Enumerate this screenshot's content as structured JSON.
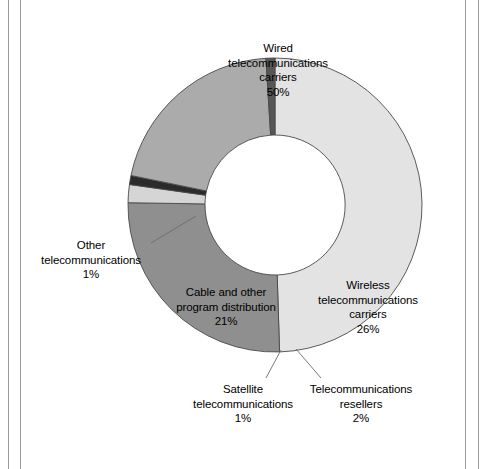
{
  "figure": {
    "background": "#ffffff",
    "frame_rule_color": "#9a9a9a"
  },
  "chart_data": {
    "type": "pie",
    "variant": "donut",
    "title": "",
    "subtitle": "",
    "xlabel": "",
    "ylabel": "",
    "legend": "none",
    "grid": false,
    "units": "percent",
    "total": 101,
    "start_angle_deg": 0,
    "direction": "clockwise",
    "center": {
      "x": 275,
      "y": 205
    },
    "outer_radius": 147,
    "inner_radius": 70,
    "labels": [
      "Wired telecommunications carriers",
      "Wireless telecommunications carriers",
      "Telecommunications resellers",
      "Satellite telecommunications",
      "Cable and other program distribution",
      "Other telecommunications"
    ],
    "values": [
      50,
      26,
      2,
      1,
      21,
      1
    ],
    "colors": [
      "#e3e3e3",
      "#8f8f8f",
      "#d5d5d5",
      "#2b2b2b",
      "#ababab",
      "#565656"
    ],
    "slices": [
      {
        "name": "wired",
        "label_lines": [
          "Wired",
          "telecommunications",
          "carriers"
        ],
        "value": 50,
        "pct_text": "50%",
        "color": "#e3e3e3",
        "label_placement": "inside"
      },
      {
        "name": "wireless",
        "label_lines": [
          "Wireless",
          "telecommunications",
          "carriers"
        ],
        "value": 26,
        "pct_text": "26%",
        "color": "#8f8f8f",
        "label_placement": "inside"
      },
      {
        "name": "resellers",
        "label_lines": [
          "Telecommunications",
          "resellers"
        ],
        "value": 2,
        "pct_text": "2%",
        "color": "#d5d5d5",
        "label_placement": "callout"
      },
      {
        "name": "satellite",
        "label_lines": [
          "Satellite",
          "telecommunications"
        ],
        "value": 1,
        "pct_text": "1%",
        "color": "#2b2b2b",
        "label_placement": "callout"
      },
      {
        "name": "cable",
        "label_lines": [
          "Cable and other",
          "program distribution"
        ],
        "value": 21,
        "pct_text": "21%",
        "color": "#ababab",
        "label_placement": "inside"
      },
      {
        "name": "other",
        "label_lines": [
          "Other",
          "telecommunications"
        ],
        "value": 1,
        "pct_text": "1%",
        "color": "#565656",
        "label_placement": "callout"
      }
    ]
  },
  "labels": {
    "wired": {
      "line1": "Wired",
      "line2": "telecommunications",
      "line3": "carriers",
      "pct": "50%"
    },
    "wireless": {
      "line1": "Wireless",
      "line2": "telecommunications",
      "line3": "carriers",
      "pct": "26%"
    },
    "cable": {
      "line1": "Cable and other",
      "line2": "program distribution",
      "pct": "21%"
    },
    "other": {
      "line1": "Other",
      "line2": "telecommunications",
      "pct": "1%"
    },
    "satellite": {
      "line1": "Satellite",
      "line2": "telecommunications",
      "pct": "1%"
    },
    "resellers": {
      "line1": "Telecommunications",
      "line2": "resellers",
      "pct": "2%"
    }
  }
}
